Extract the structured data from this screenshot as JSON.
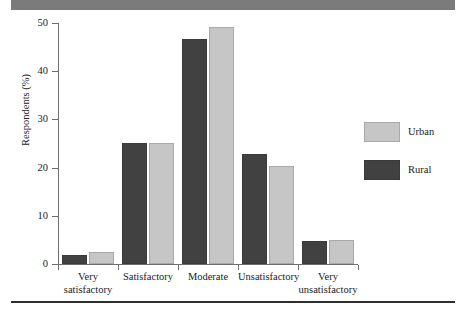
{
  "chart_data": {
    "type": "bar",
    "title": "",
    "subtitle": "",
    "xlabel": "",
    "ylabel": "Respondents (%)",
    "ylim": [
      0,
      50
    ],
    "yticks": [
      0,
      10,
      20,
      30,
      40,
      50
    ],
    "ytick_labels": [
      "0",
      "10",
      "20",
      "30",
      "40",
      "50"
    ],
    "grid": false,
    "legend_position": "right",
    "categories": [
      "Very satisfactory",
      "Satisfactory",
      "Moderate",
      "Unsatisfactory",
      "Very unsatisfactory"
    ],
    "category_lines": [
      [
        "Very",
        "satisfactory"
      ],
      [
        "Satisfactory",
        ""
      ],
      [
        "Moderate",
        ""
      ],
      [
        "Unsatisfactory",
        ""
      ],
      [
        "Very",
        "unsatisfactory"
      ]
    ],
    "series": [
      {
        "name": "Rural",
        "color": "#414141",
        "values": [
          1.8,
          25.1,
          46.6,
          22.8,
          4.7
        ]
      },
      {
        "name": "Urban",
        "color": "#c6c6c6",
        "values": [
          2.5,
          25.1,
          49.2,
          20.3,
          5.0
        ]
      }
    ]
  },
  "legend": {
    "items": [
      {
        "label": "Urban",
        "swatch": "urban"
      },
      {
        "label": "Rural",
        "swatch": "rural"
      }
    ]
  },
  "decor": {
    "banner_color": "#7b7b7b",
    "rule_color": "#2e2e2e"
  }
}
